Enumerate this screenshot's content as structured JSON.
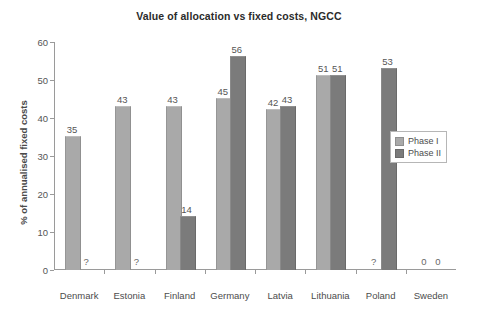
{
  "chart_data": {
    "type": "bar",
    "title": "Value of allocation vs fixed costs, NGCC",
    "xlabel": "",
    "ylabel": "% of annualised fixed costs",
    "ylim": [
      0,
      60
    ],
    "yticks": [
      0,
      10,
      20,
      30,
      40,
      50,
      60
    ],
    "grid": false,
    "legend_position": "right",
    "categories": [
      "Denmark",
      "Estonia",
      "Finland",
      "Germany",
      "Latvia",
      "Lithuania",
      "Poland",
      "Sweden"
    ],
    "series": [
      {
        "name": "Phase I",
        "color": "#a9a9a9",
        "values": [
          35,
          43,
          43,
          45,
          42,
          51,
          null,
          0
        ],
        "labels": [
          "35",
          "43",
          "43",
          "45",
          "42",
          "51",
          "?",
          "0"
        ]
      },
      {
        "name": "Phase II",
        "color": "#7b7b7b",
        "values": [
          null,
          null,
          14,
          56,
          43,
          51,
          53,
          0
        ],
        "labels": [
          "?",
          "?",
          "14",
          "56",
          "43",
          "51",
          "53",
          "0"
        ]
      }
    ]
  },
  "legend": {
    "items": [
      {
        "label": "Phase I",
        "swatch": "phase1"
      },
      {
        "label": "Phase II",
        "swatch": "phase2"
      }
    ]
  }
}
